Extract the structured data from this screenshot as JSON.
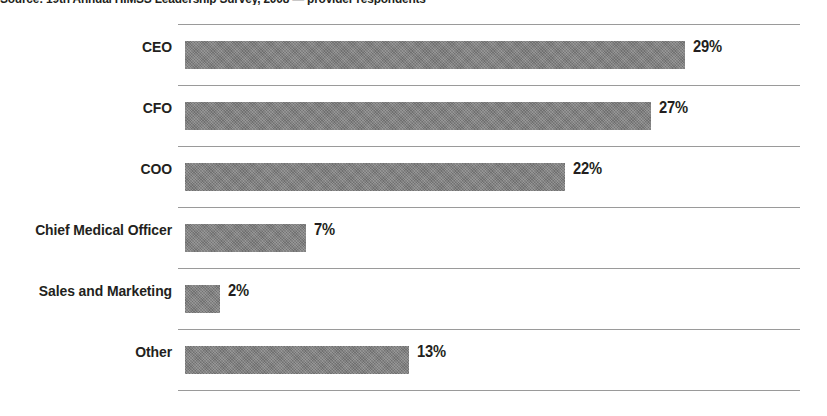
{
  "source_note": "Source: 19th Annual HIMSS Leadership Survey, 2008 — provider respondents",
  "chart_data": {
    "type": "bar",
    "orientation": "horizontal",
    "title": "",
    "subtitle": "",
    "xlabel": "",
    "ylabel": "",
    "categories": [
      "CEO",
      "CFO",
      "COO",
      "Chief Medical Officer",
      "Sales and Marketing",
      "Other"
    ],
    "values": [
      29,
      27,
      22,
      7,
      2,
      13
    ],
    "value_labels": [
      "29%",
      "27%",
      "22%",
      "7%",
      "2%",
      "13%"
    ],
    "value_suffix": "%",
    "xlim": [
      0,
      36
    ],
    "grid": true,
    "grid_axis": "y",
    "legend": "none",
    "bar_color": "#7d7d7d",
    "grid_color": "#9a9a9a",
    "text_color": "#231f20",
    "background_color": "#ffffff"
  }
}
